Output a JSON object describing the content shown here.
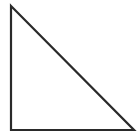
{
  "figure": {
    "name": "right-triangle",
    "background_color": "#ffffff",
    "stroke_color": "#2a2a2a",
    "stroke_width": 2.2,
    "canvas": {
      "width": 139,
      "height": 137
    },
    "vertices": [
      {
        "name": "top-left-apex",
        "x": 11,
        "y": 6
      },
      {
        "name": "bottom-right",
        "x": 134,
        "y": 130
      },
      {
        "name": "bottom-left-right-angle",
        "x": 11,
        "y": 130
      }
    ],
    "points_attr": "11,6 134,130 11,130",
    "edges": [
      {
        "name": "vertical-leg",
        "from": "top-left-apex",
        "to": "bottom-left-right-angle"
      },
      {
        "name": "horizontal-leg",
        "from": "bottom-left-right-angle",
        "to": "bottom-right"
      },
      {
        "name": "hypotenuse",
        "from": "top-left-apex",
        "to": "bottom-right"
      }
    ]
  }
}
